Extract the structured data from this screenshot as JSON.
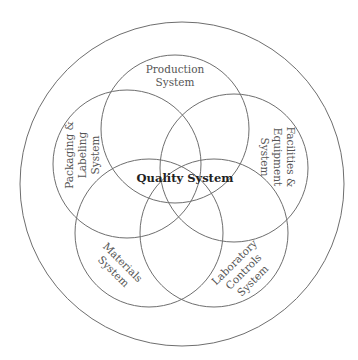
{
  "diagram": {
    "title": "Quality System",
    "center_label": "Quality System",
    "outer_circle": {
      "cx": 182,
      "cy": 184,
      "r": 162
    },
    "subsystems": [
      {
        "id": "production",
        "lines": [
          "Production",
          "System"
        ],
        "cx": 175,
        "cy": 129,
        "r": 74
      },
      {
        "id": "packaging-labeling",
        "lines": [
          "Packaging &",
          "Labeling",
          "System"
        ],
        "cx": 127,
        "cy": 164,
        "r": 74
      },
      {
        "id": "facilities-equipment",
        "lines": [
          "Facilities &",
          "Equipment",
          "System"
        ],
        "cx": 234,
        "cy": 168,
        "r": 74
      },
      {
        "id": "materials",
        "lines": [
          "Materials",
          "System"
        ],
        "cx": 149,
        "cy": 233,
        "r": 74
      },
      {
        "id": "laboratory-controls",
        "lines": [
          "Laboratory",
          "Controls",
          "System"
        ],
        "cx": 214,
        "cy": 233,
        "r": 74
      }
    ],
    "line_color": "#6e6e6e",
    "background": "#ffffff"
  },
  "labels": {
    "production_1": "Production",
    "production_2": "System",
    "packaging_1": "Packaging &",
    "packaging_2": "Labeling",
    "packaging_3": "System",
    "facilities_1": "Facilities &",
    "facilities_2": "Equipment",
    "facilities_3": "System",
    "materials_1": "Materials",
    "materials_2": "System",
    "laboratory_1": "Laboratory",
    "laboratory_2": "Controls",
    "laboratory_3": "System",
    "center": "Quality System"
  }
}
